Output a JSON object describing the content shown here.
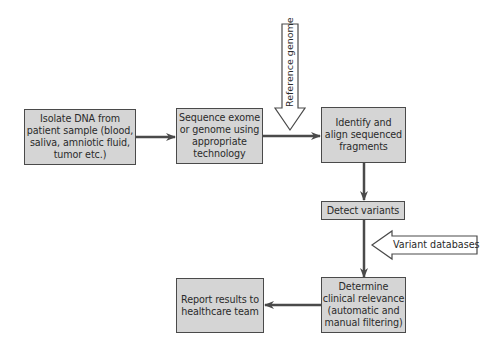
{
  "diagram": {
    "type": "flowchart",
    "nodes": [
      {
        "id": "isolate",
        "label": "Isolate DNA from\npatient sample (blood,\nsaliva, amniotic fluid,\ntumor etc.)"
      },
      {
        "id": "sequence",
        "label": "Sequence exome\nor genome using\nappropriate\ntechnology"
      },
      {
        "id": "align",
        "label": "Identify and\nalign sequenced\nfragments"
      },
      {
        "id": "detect",
        "label": "Detect variants"
      },
      {
        "id": "determine",
        "label": "Determine\nclinical relevance\n(automatic and\nmanual filtering)"
      },
      {
        "id": "report",
        "label": "Report results to\nhealthcare team"
      }
    ],
    "inputs": [
      {
        "id": "reference",
        "label": "Reference genome",
        "target": "align",
        "direction": "down"
      },
      {
        "id": "variantdb",
        "label": "Variant databases",
        "target": "determine",
        "direction": "left"
      }
    ],
    "edges": [
      {
        "from": "isolate",
        "to": "sequence"
      },
      {
        "from": "sequence",
        "to": "align"
      },
      {
        "from": "align",
        "to": "detect"
      },
      {
        "from": "detect",
        "to": "determine"
      },
      {
        "from": "determine",
        "to": "report"
      }
    ],
    "colors": {
      "box_fill": "#d5d5d5",
      "box_border": "#4a4a4a",
      "arrow": "#4a4a4a",
      "input_arrow_fill": "#ffffff"
    }
  }
}
